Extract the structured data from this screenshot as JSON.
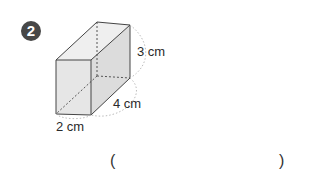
{
  "problem": {
    "number": "2",
    "badge_color": "#474747"
  },
  "figure": {
    "type": "rectangular-prism",
    "dimensions": {
      "width": "2 cm",
      "depth": "4 cm",
      "height": "3 cm"
    }
  },
  "answer": {
    "open_paren": "(",
    "close_paren": ")",
    "value": ""
  }
}
